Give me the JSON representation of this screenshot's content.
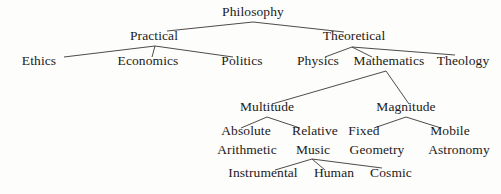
{
  "diagram": {
    "type": "tree",
    "background_color": "#fdfdfc",
    "text_color": "#1c1a19",
    "edge_color": "#3a3734",
    "nodes": [
      {
        "id": "philosophy",
        "label": "Philosophy",
        "x": 253,
        "y": 18,
        "level": 0
      },
      {
        "id": "practical",
        "label": "Practical",
        "x": 154,
        "y": 42,
        "level": 1
      },
      {
        "id": "theoretical",
        "label": "Theoretical",
        "x": 354,
        "y": 42,
        "level": 1
      },
      {
        "id": "ethics",
        "label": "Ethics",
        "x": 39,
        "y": 67,
        "level": 2
      },
      {
        "id": "economics",
        "label": "Economics",
        "x": 148,
        "y": 67,
        "level": 2
      },
      {
        "id": "politics",
        "label": "Politics",
        "x": 242,
        "y": 67,
        "level": 2
      },
      {
        "id": "physics",
        "label": "Physics",
        "x": 318,
        "y": 67,
        "level": 2
      },
      {
        "id": "mathematics",
        "label": "Mathematics",
        "x": 389,
        "y": 67,
        "level": 2
      },
      {
        "id": "theology",
        "label": "Theology",
        "x": 463,
        "y": 67,
        "level": 2
      },
      {
        "id": "multitude",
        "label": "Multitude",
        "x": 267,
        "y": 113,
        "level": 3
      },
      {
        "id": "magnitude",
        "label": "Magnitude",
        "x": 406,
        "y": 113,
        "level": 3
      },
      {
        "id": "absolute",
        "label": "Absolute",
        "x": 246,
        "y": 137,
        "level": 4
      },
      {
        "id": "relative",
        "label": "Relative",
        "x": 315,
        "y": 137,
        "level": 4
      },
      {
        "id": "fixed",
        "label": "Fixed",
        "x": 364,
        "y": 137,
        "level": 4
      },
      {
        "id": "mobile",
        "label": "Mobile",
        "x": 450,
        "y": 137,
        "level": 4
      },
      {
        "id": "arithmetic",
        "label": "Arithmetic",
        "x": 247,
        "y": 156,
        "level": 5
      },
      {
        "id": "music",
        "label": "Music",
        "x": 313,
        "y": 156,
        "level": 5
      },
      {
        "id": "geometry",
        "label": "Geometry",
        "x": 377,
        "y": 156,
        "level": 5
      },
      {
        "id": "astronomy",
        "label": "Astronomy",
        "x": 459,
        "y": 156,
        "level": 5
      },
      {
        "id": "instrumental",
        "label": "Instrumental",
        "x": 263,
        "y": 179,
        "level": 6
      },
      {
        "id": "human",
        "label": "Human",
        "x": 334,
        "y": 179,
        "level": 6
      },
      {
        "id": "cosmic",
        "label": "Cosmic",
        "x": 391,
        "y": 179,
        "level": 6
      }
    ],
    "edges": [
      {
        "from": "philosophy",
        "to": "practical",
        "path": "M253,22 L167,31"
      },
      {
        "from": "philosophy",
        "to": "theoretical",
        "path": "M253,22 L344,32"
      },
      {
        "from": "practical",
        "to": "ethics",
        "path": "M155,46 L64,57"
      },
      {
        "from": "practical",
        "to": "economics",
        "path": "M155,46 L152,57"
      },
      {
        "from": "practical",
        "to": "politics",
        "path": "M155,46 L233,57"
      },
      {
        "from": "theoretical",
        "to": "physics",
        "path": "M352,47 L325,57"
      },
      {
        "from": "theoretical",
        "to": "mathematics",
        "path": "M352,47 L372,57"
      },
      {
        "from": "theoretical",
        "to": "theology",
        "path": "M352,47 L455,55"
      },
      {
        "from": "mathematics",
        "to": "multitude",
        "path": "M386,71 L272,104"
      },
      {
        "from": "mathematics",
        "to": "magnitude",
        "path": "M386,71 L409,104"
      },
      {
        "from": "multitude",
        "to": "absolute",
        "path": "M267,117 L241,128"
      },
      {
        "from": "multitude",
        "to": "relative",
        "path": "M267,117 L300,128"
      },
      {
        "from": "magnitude",
        "to": "fixed",
        "path": "M406,117 L374,128"
      },
      {
        "from": "magnitude",
        "to": "mobile",
        "path": "M406,117 L441,128"
      },
      {
        "from": "music",
        "to": "instrumental",
        "path": "M312,159 L275,170"
      },
      {
        "from": "music",
        "to": "human",
        "path": "M312,159 L325,170"
      },
      {
        "from": "music",
        "to": "cosmic",
        "path": "M312,159 L382,168"
      }
    ]
  }
}
